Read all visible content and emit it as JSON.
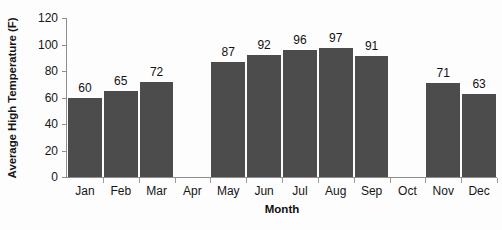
{
  "chart_data": {
    "type": "bar",
    "title": "",
    "xlabel": "Month",
    "ylabel": "Average High Temperature (F)",
    "categories": [
      "Jan",
      "Feb",
      "Mar",
      "Apr",
      "May",
      "Jun",
      "Jul",
      "Aug",
      "Sep",
      "Oct",
      "Nov",
      "Dec"
    ],
    "values": [
      60,
      65,
      72,
      null,
      87,
      92,
      96,
      97,
      91,
      null,
      71,
      63
    ],
    "data_labels": [
      "60",
      "65",
      "72",
      "",
      "87",
      "92",
      "96",
      "97",
      "91",
      "",
      "71",
      "63"
    ],
    "missing_categories": [
      "Apr",
      "Oct"
    ],
    "ylim": [
      0,
      120
    ],
    "ytick_labels": [
      "0",
      "20",
      "40",
      "60",
      "80",
      "100",
      "120"
    ],
    "ytick_values": [
      0,
      20,
      40,
      60,
      80,
      100,
      120
    ],
    "grid": false,
    "legend": null,
    "bar_color": "#4c4c4c",
    "axis_color": "#8d8d8d",
    "background_color": "#fdfdfd",
    "text_color": "#151515"
  }
}
